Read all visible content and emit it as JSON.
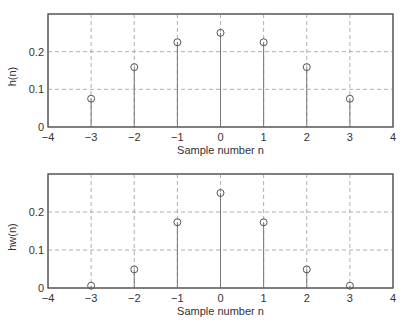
{
  "chart_data": [
    {
      "type": "stem",
      "title": "",
      "xlabel": "Sample number n",
      "ylabel": "h(n)",
      "x": [
        -3,
        -2,
        -1,
        0,
        1,
        2,
        3
      ],
      "values": [
        0.075,
        0.159,
        0.225,
        0.25,
        0.225,
        0.159,
        0.075
      ],
      "xlim": [
        -4,
        4
      ],
      "ylim": [
        0,
        0.3
      ],
      "xticks": [
        -4,
        -3,
        -2,
        -1,
        0,
        1,
        2,
        3,
        4
      ],
      "xtick_labels": [
        "−4",
        "−3",
        "−2",
        "−1",
        "0",
        "1",
        "2",
        "3",
        "4"
      ],
      "yticks": [
        0,
        0.1,
        0.2
      ],
      "ytick_labels": [
        "0",
        "0.1",
        "0.2"
      ],
      "grid": true,
      "marker": "circle-open"
    },
    {
      "type": "stem",
      "title": "",
      "xlabel": "Sample number n",
      "ylabel": "hw(n)",
      "x": [
        -3,
        -2,
        -1,
        0,
        1,
        2,
        3
      ],
      "values": [
        0.006,
        0.049,
        0.173,
        0.25,
        0.173,
        0.049,
        0.006
      ],
      "xlim": [
        -4,
        4
      ],
      "ylim": [
        0,
        0.3
      ],
      "xticks": [
        -4,
        -3,
        -2,
        -1,
        0,
        1,
        2,
        3,
        4
      ],
      "xtick_labels": [
        "−4",
        "−3",
        "−2",
        "−1",
        "0",
        "1",
        "2",
        "3",
        "4"
      ],
      "yticks": [
        0,
        0.1,
        0.2
      ],
      "ytick_labels": [
        "0",
        "0.1",
        "0.2"
      ],
      "grid": true,
      "marker": "circle-open"
    }
  ],
  "layout": {
    "panels": [
      {
        "left": 48,
        "top": 14,
        "right": 393,
        "bottom": 127,
        "tick_label_y": 141,
        "xlabel_y": 154
      },
      {
        "left": 48,
        "top": 174,
        "right": 393,
        "bottom": 288,
        "tick_label_y": 302,
        "xlabel_y": 315
      }
    ]
  }
}
